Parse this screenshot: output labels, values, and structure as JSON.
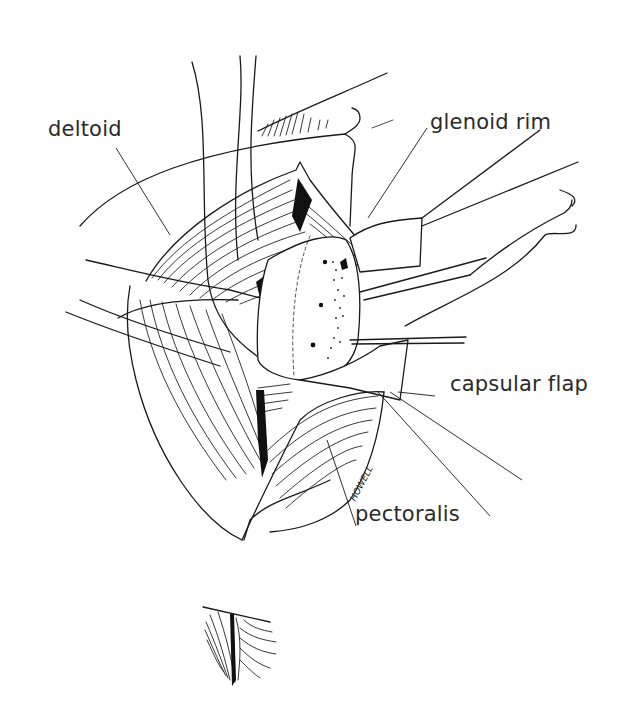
{
  "figure": {
    "type": "anatomical line illustration",
    "ink_color": "#1a1a1a",
    "background": "#ffffff"
  },
  "labels": [
    {
      "id": "deltoid",
      "text": "deltoid"
    },
    {
      "id": "glenoid_rim",
      "text": "glenoid rim"
    },
    {
      "id": "capsular_flap",
      "text": "capsular flap"
    },
    {
      "id": "pectoralis",
      "text": "pectoralis"
    }
  ],
  "signature": "HOWELL"
}
